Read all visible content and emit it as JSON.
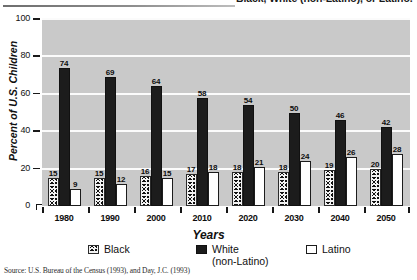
{
  "figure": {
    "title_visible_fragment": "Black, White (non-Latino), or Latino.",
    "source": "Source: U.S. Bureau of the Census (1993), and Day, J.C. (1993)"
  },
  "chart_data": {
    "type": "bar",
    "title": "Black, White (non-Latino), or Latino.",
    "xlabel": "Years",
    "ylabel": "Percent of U.S. Children",
    "ylim": [
      0,
      100
    ],
    "yticks": [
      0,
      20,
      40,
      60,
      80,
      100
    ],
    "grid": true,
    "legend_position": "bottom",
    "categories": [
      "1980",
      "1990",
      "2000",
      "2010",
      "2020",
      "2030",
      "2040",
      "2050"
    ],
    "series": [
      {
        "name": "Black",
        "pattern": "stippled",
        "values": [
          15,
          15,
          16,
          17,
          18,
          18,
          19,
          20
        ]
      },
      {
        "name": "White (non-Latino)",
        "pattern": "solid-black",
        "values": [
          74,
          69,
          64,
          58,
          54,
          50,
          46,
          42
        ]
      },
      {
        "name": "Latino",
        "pattern": "outline-white",
        "values": [
          9,
          12,
          15,
          18,
          21,
          24,
          26,
          28
        ]
      }
    ]
  },
  "legend": {
    "items": [
      {
        "label": "Black",
        "swatch": "black-series"
      },
      {
        "label": "White\n(non-Latino)",
        "swatch": "white-series"
      },
      {
        "label": "Latino",
        "swatch": "latino-series"
      }
    ]
  }
}
